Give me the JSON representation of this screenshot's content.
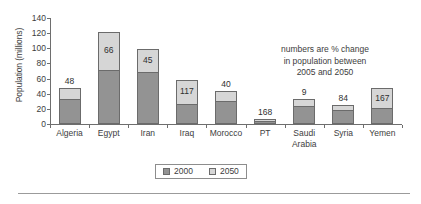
{
  "chart_data": {
    "type": "bar",
    "stacked": true,
    "title": "",
    "xlabel": "",
    "ylabel": "Population (millions)",
    "ylim": [
      0,
      140
    ],
    "yticks": [
      0,
      20,
      40,
      60,
      80,
      100,
      120,
      140
    ],
    "grid": false,
    "legend_position": "bottom-center",
    "categories": [
      "Algeria",
      "Egypt",
      "Iran",
      "Iraq",
      "Morocco",
      "PT",
      "Saudi\nArabia",
      "Syria",
      "Yemen"
    ],
    "series": [
      {
        "name": "2000",
        "color": "#939393",
        "values": [
          33,
          72,
          69,
          27,
          31,
          4,
          24,
          19,
          21
        ]
      },
      {
        "name": "2050",
        "color": "#d6d6d6",
        "values": [
          15,
          49,
          30,
          31,
          12,
          3,
          9,
          6,
          26
        ]
      }
    ],
    "totals": [
      48,
      121,
      99,
      58,
      43,
      7,
      33,
      25,
      47
    ],
    "data_labels": [
      "48",
      "66",
      "45",
      "117",
      "40",
      "168",
      "9",
      "84",
      "167"
    ],
    "data_label_meaning": "numbers are % change in population between 2005 and 2050",
    "annotation": {
      "line1": "numbers are % change",
      "line2": "in population between",
      "line3": "2005 and 2050"
    },
    "legend": [
      {
        "label": "2000",
        "color": "#939393"
      },
      {
        "label": "2050",
        "color": "#d6d6d6"
      }
    ]
  }
}
